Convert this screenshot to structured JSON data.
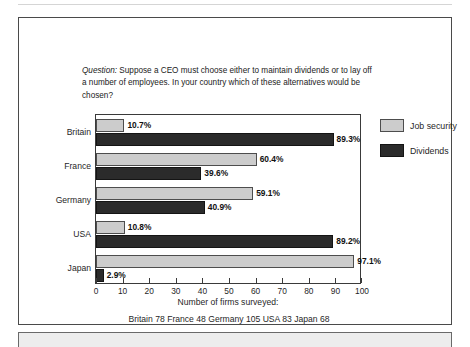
{
  "figure": {
    "question_label": "Question:",
    "question_text": " Suppose a CEO must choose either to maintain dividends or to lay off a number of employees. In your country which of these alternatives would be chosen?",
    "axis_caption": "Number of firms surveyed:",
    "firms_note": "Britain 78   France 48   Germany 105   USA 83   Japan 68"
  },
  "legend": {
    "items": [
      {
        "label": "Job security",
        "color": "#cccccc",
        "swatch": "light-gray-swatch"
      },
      {
        "label": "Dividends",
        "color": "#2b2b2b",
        "swatch": "dark-swatch"
      }
    ]
  },
  "chart_data": {
    "type": "bar",
    "orientation": "horizontal",
    "title": "",
    "subtitle": "Question: Suppose a CEO must choose either to maintain dividends or to lay off a number of employees. In your country which of these alternatives would be chosen?",
    "categories": [
      "Britain",
      "France",
      "Germany",
      "USA",
      "Japan"
    ],
    "series": [
      {
        "name": "Job security",
        "color": "#cccccc",
        "values": [
          10.7,
          60.4,
          59.1,
          10.8,
          97.1
        ],
        "labels": [
          "10.7%",
          "60.4%",
          "59.1%",
          "10.8%",
          "97.1%"
        ]
      },
      {
        "name": "Dividends",
        "color": "#2b2b2b",
        "values": [
          89.3,
          39.6,
          40.9,
          89.2,
          2.9
        ],
        "labels": [
          "89.3%",
          "39.6%",
          "40.9%",
          "89.2%",
          "2.9%"
        ]
      }
    ],
    "xlabel": "Number of firms surveyed:",
    "ylabel": "",
    "xlim": [
      0,
      100
    ],
    "xticks": [
      0,
      10,
      20,
      30,
      40,
      50,
      60,
      70,
      80,
      90,
      100
    ],
    "xtick_labels": [
      "0",
      "10",
      "20",
      "30",
      "40",
      "50",
      "60",
      "70",
      "80",
      "90",
      "100"
    ],
    "grid": false,
    "legend_position": "right",
    "annotations": [
      "Britain 78",
      "France 48",
      "Germany 105",
      "USA 83",
      "Japan 68"
    ],
    "firms_surveyed": {
      "Britain": 78,
      "France": 48,
      "Germany": 105,
      "USA": 83,
      "Japan": 68
    }
  }
}
